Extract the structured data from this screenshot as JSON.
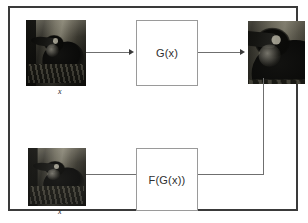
{
  "figure": {
    "background_color": "#ffffff",
    "frame_color": "#3a3a3a",
    "box_border_color": "#9a9a9a",
    "connector_color": "#6f6f6f"
  },
  "nodes": {
    "generator_g": {
      "label": "G(x)",
      "name": "generator-box"
    },
    "generator_fg": {
      "label": "F(G(x))",
      "name": "reconstruction-box"
    }
  },
  "images": {
    "input": {
      "caption": "x",
      "alt": "toucan perched on branch, grayscale input photo"
    },
    "generated": {
      "caption": "",
      "alt": "toucan close-up, grayscale generated photo"
    },
    "reconstructed": {
      "caption": "x",
      "alt": "toucan perched on branch, grayscale reconstructed photo"
    }
  },
  "arrows": [
    {
      "name": "arrow-input-to-g",
      "from": "input-image",
      "to": "generator-box",
      "direction": "right"
    },
    {
      "name": "arrow-g-to-generated",
      "from": "generator-box",
      "to": "generated-image",
      "direction": "right"
    },
    {
      "name": "arrow-generated-to-fg",
      "from": "generated-image",
      "to": "reconstruction-box",
      "direction": "left"
    },
    {
      "name": "arrow-fg-to-reconstructed",
      "from": "reconstruction-box",
      "to": "reconstructed-image",
      "direction": "left"
    }
  ]
}
